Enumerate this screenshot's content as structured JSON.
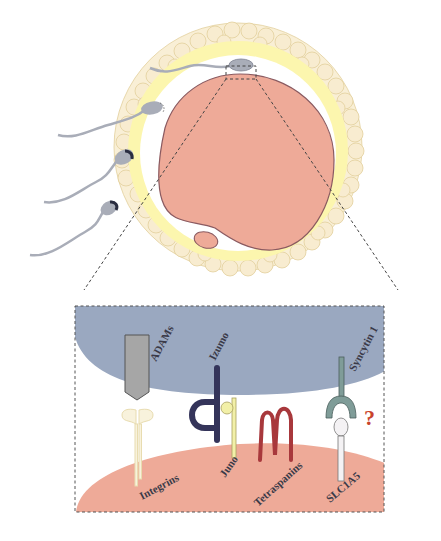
{
  "diagram": {
    "overview": {
      "elements": [
        "cumulus-cells",
        "zona-pellucida",
        "perivitelline-space",
        "oocyte",
        "polar-body",
        "sperm"
      ],
      "sperm_count": 4
    },
    "inset": {
      "sperm_proteins": [
        {
          "name": "ADAMs",
          "color": "#a6a6a6"
        },
        {
          "name": "Izumo",
          "color": "#34345a"
        },
        {
          "name": "Syncytin 1",
          "color": "#7f9c98"
        }
      ],
      "oocyte_proteins": [
        {
          "name": "Integrins",
          "color": "#f5edd2"
        },
        {
          "name": "Juno",
          "color": "#f2f0a8"
        },
        {
          "name": "Tetraspanins",
          "color": "#a8383c"
        },
        {
          "name": "SLC1A5",
          "color": "#f4f2f4"
        }
      ],
      "unknown_marker": "?"
    },
    "labels": {
      "adams": "ADAMs",
      "izumo": "Izumo",
      "syncytin": "Syncytin 1",
      "integrins": "Integrins",
      "juno": "Juno",
      "tetraspanins": "Tetraspanins",
      "slc1a5": "SLC1A5",
      "question": "?"
    },
    "colors": {
      "oocyte": "#eeaa98",
      "oocyte_outline": "#8a5a5a",
      "zona": "#fcf7b0",
      "cumulus": "#f8ecd0",
      "cumulus_outline": "#e0cc96",
      "sperm_membrane": "#9aa8c0",
      "sperm": "#a9adb8"
    }
  }
}
